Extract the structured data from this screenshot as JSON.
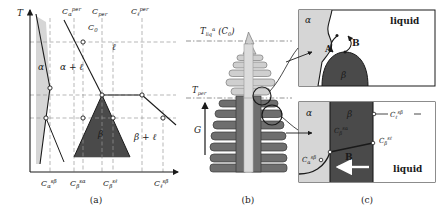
{
  "figure": {
    "caption_panels": [
      "(a)",
      "(b)",
      "(c)"
    ]
  },
  "panel_a": {
    "label": "(a)",
    "axis": {
      "y_label": "T",
      "x_label": ""
    },
    "top_concentration_labels": [
      {
        "id": "c-alpha-per",
        "base": "C",
        "sub": "α",
        "sup": "per"
      },
      {
        "id": "c-per",
        "base": "C",
        "sub": "per",
        "sup": ""
      },
      {
        "id": "c-zero",
        "base": "C",
        "sub": "0",
        "sup": ""
      },
      {
        "id": "c-liquid-per",
        "base": "C",
        "sub": "ℓ",
        "sup": "per"
      }
    ],
    "bottom_concentration_labels": [
      {
        "id": "c-alpha-sbeta",
        "base": "C",
        "sub": "α",
        "sup": "sβ"
      },
      {
        "id": "c-beta-salpha",
        "base": "C",
        "sub": "β",
        "sup": "sα"
      },
      {
        "id": "c-beta-sliquid",
        "base": "C",
        "sub": "β",
        "sup": "sℓ"
      },
      {
        "id": "c-liquid-sbeta",
        "base": "C",
        "sub": "ℓ",
        "sup": "sβ"
      }
    ],
    "region_labels": [
      {
        "id": "region-alpha",
        "text": "α"
      },
      {
        "id": "region-alpha-liquid",
        "text": "α + ℓ"
      },
      {
        "id": "region-liquid",
        "text": "ℓ"
      },
      {
        "id": "region-beta",
        "text": "β"
      },
      {
        "id": "region-beta-liquid",
        "text": "β + ℓ"
      }
    ]
  },
  "panel_b": {
    "label": "(b)",
    "temperature_lines": [
      {
        "id": "t-liq-alpha-c0",
        "base": "T",
        "sub": "liq",
        "sup": "α",
        "suffix": "(C",
        "suffix_sub": "0",
        "suffix_end": ")"
      },
      {
        "id": "t-per",
        "base": "T",
        "sub": "per",
        "sup": ""
      }
    ],
    "gradient_label": "G"
  },
  "panel_c": {
    "label": "(c)",
    "top_box": {
      "phase_labels": [
        {
          "id": "alpha-phase",
          "text": "α"
        },
        {
          "id": "beta-phase",
          "text": "β"
        },
        {
          "id": "liquid-phase",
          "text": "liquid"
        }
      ],
      "arrow_labels": [
        {
          "id": "arrow-a",
          "text": "A"
        },
        {
          "id": "arrow-b",
          "text": "B"
        }
      ]
    },
    "bottom_box": {
      "phase_labels": [
        {
          "id": "alpha-phase",
          "text": "α"
        },
        {
          "id": "beta-phase",
          "text": "β"
        },
        {
          "id": "liquid-phase",
          "text": "liquid"
        }
      ],
      "arrow_labels": [
        {
          "id": "arrow-b",
          "text": "B"
        }
      ],
      "concentration_labels": [
        {
          "id": "c-liquid-sbeta",
          "base": "C",
          "sub": "ℓ",
          "sup": "sβ"
        },
        {
          "id": "c-beta-sliquid",
          "base": "C",
          "sub": "β",
          "sup": "sℓ"
        },
        {
          "id": "c-beta-salpha",
          "base": "C",
          "sub": "β",
          "sup": "sα"
        },
        {
          "id": "c-alpha-sbeta",
          "base": "C",
          "sub": "α",
          "sup": "sβ"
        }
      ]
    }
  },
  "colors": {
    "alpha_fill": "#d6d6d6",
    "beta_fill": "#4a4a4a",
    "liquid_fill": "#ffffff",
    "line": "#1a1a1a",
    "dash": "#999999",
    "dendrite_light": "#cfcfcf",
    "dendrite_dark": "#6e6e6e",
    "dendrite_core": "#dcdcdc"
  }
}
